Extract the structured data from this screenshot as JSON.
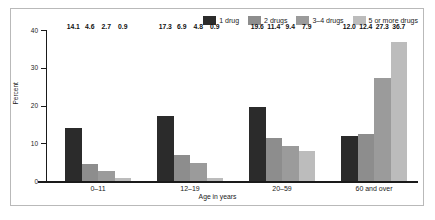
{
  "chart_data": {
    "type": "bar",
    "title": "",
    "subtitle": "",
    "xlabel": "Age in years",
    "ylabel": "Percent",
    "categories": [
      "0–11",
      "12–19",
      "20–59",
      "60 and over"
    ],
    "ylim": [
      0,
      40
    ],
    "yticks": [
      0,
      10,
      20,
      30,
      40
    ],
    "ytick_labels": [
      "0",
      "10",
      "20",
      "30",
      "40"
    ],
    "grid": false,
    "legend_position": "top-right",
    "series": [
      {
        "name": "1 drug",
        "color": "#2b2b2b",
        "values": [
          14.1,
          17.3,
          19.6,
          12.0
        ],
        "labels": [
          "14.1",
          "17.3",
          "19.6",
          "12.0"
        ]
      },
      {
        "name": "2 drugs",
        "color": "#8d8d8d",
        "values": [
          4.6,
          6.9,
          11.4,
          12.4
        ],
        "labels": [
          "4.6",
          "6.9",
          "11.4",
          "12.4"
        ]
      },
      {
        "name": "3–4 drugs",
        "color": "#9b9b9b",
        "values": [
          2.7,
          4.8,
          9.4,
          27.3
        ],
        "labels": [
          "2.7",
          "4.8",
          "9.4",
          "27.3"
        ]
      },
      {
        "name": "5 or more drugs",
        "color": "#bcbcbc",
        "values": [
          0.9,
          0.9,
          7.9,
          36.7
        ],
        "labels": [
          "0.9",
          "0.9",
          "7.9",
          "36.7"
        ]
      }
    ]
  },
  "colors": {
    "frame": "#b9b9b9",
    "axis": "#1a1a1a",
    "text": "#1a1a1a",
    "background": "#ffffff"
  }
}
